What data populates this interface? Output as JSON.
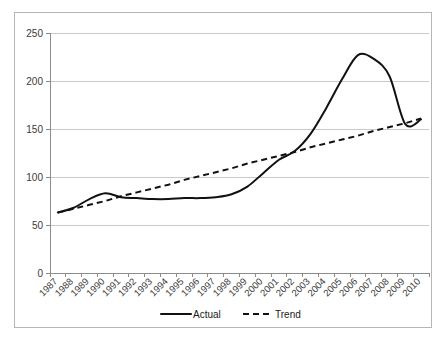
{
  "chart_data": {
    "type": "line",
    "title": "",
    "subtitle": "",
    "xlabel": "",
    "ylabel": "",
    "grid": true,
    "legend_position": "bottom",
    "xlim": [
      1987,
      2010
    ],
    "ylim": [
      0,
      250
    ],
    "ytick_labels": [
      "250",
      "200",
      "150",
      "100",
      "50",
      "0"
    ],
    "ytick_values": [
      250,
      200,
      150,
      100,
      50,
      0
    ],
    "categories": [
      "1987",
      "1988",
      "1989",
      "1990",
      "1991",
      "1992",
      "1993",
      "1994",
      "1995",
      "1996",
      "1997",
      "1998",
      "1999",
      "2000",
      "2001",
      "2002",
      "2003",
      "2004",
      "2005",
      "2006",
      "2007",
      "2008",
      "2009",
      "2010"
    ],
    "series": [
      {
        "name": "Actual",
        "style": "solid",
        "color": "#111111",
        "values": [
          63,
          68,
          77,
          83,
          79,
          78,
          77,
          77,
          78,
          78,
          79,
          82,
          90,
          104,
          118,
          127,
          145,
          172,
          202,
          227,
          223,
          205,
          155,
          160
        ]
      },
      {
        "name": "Trend",
        "style": "dashed",
        "color": "#111111",
        "values": [
          63,
          67,
          71,
          75,
          80,
          84,
          88,
          92,
          97,
          101,
          105,
          109,
          114,
          118,
          122,
          126,
          131,
          135,
          139,
          143,
          148,
          152,
          156,
          161
        ]
      }
    ],
    "legend": [
      {
        "label": "Actual",
        "style": "solid"
      },
      {
        "label": "Trend",
        "style": "dashed"
      }
    ]
  }
}
